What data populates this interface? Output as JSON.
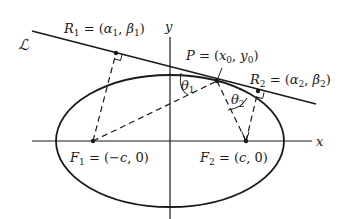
{
  "diagram": {
    "type": "ellipse-reflection-property",
    "line_label": "ℒ",
    "axes": {
      "x_label": "x",
      "y_label": "y"
    },
    "points": {
      "R1": {
        "name": "R",
        "sub": "1",
        "eq": " = (",
        "a": "α",
        "a_sub": "1",
        "sep": ",  ",
        "b": "β",
        "b_sub": "1",
        "close": ")"
      },
      "P": {
        "name": "P",
        "eq": " = (",
        "a": "x",
        "a_sub": "0",
        "sep": ", ",
        "b": "y",
        "b_sub": "0",
        "close": ")"
      },
      "R2": {
        "name": "R",
        "sub": "2",
        "eq": " = (",
        "a": "α",
        "a_sub": "2",
        "sep": ",  ",
        "b": "β",
        "b_sub": "2",
        "close": ")"
      },
      "F1": {
        "name": "F",
        "sub": "1",
        "eq": " = (−",
        "a": "c",
        "rest": ", 0)"
      },
      "F2": {
        "name": "F",
        "sub": "2",
        "eq": " = (",
        "a": "c",
        "rest": ", 0)"
      }
    },
    "angles": {
      "theta1": {
        "sym": "θ",
        "sub": "1"
      },
      "theta2": {
        "sym": "θ",
        "sub": "2"
      }
    },
    "colors": {
      "stroke": "#1a1a1a",
      "background": "#ffffff"
    }
  }
}
